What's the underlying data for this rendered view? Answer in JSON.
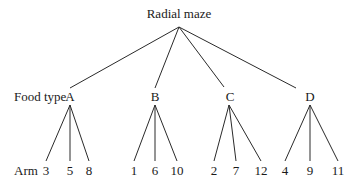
{
  "title": "Radial maze",
  "levels": {
    "food_label": "Food type",
    "arm_label": "Arm"
  },
  "root": {
    "label": "Radial maze",
    "x": 179,
    "y": 18,
    "apex_y": 27
  },
  "food_types": [
    {
      "label": "A",
      "x": 70,
      "y": 101,
      "edge_top": [
        70,
        88
      ],
      "apex": [
        70,
        105
      ],
      "arms": [
        {
          "label": "3",
          "x": 46
        },
        {
          "label": "5",
          "x": 70
        },
        {
          "label": "8",
          "x": 89
        }
      ]
    },
    {
      "label": "B",
      "x": 155,
      "y": 101,
      "edge_top": [
        155,
        88
      ],
      "apex": [
        155,
        105
      ],
      "arms": [
        {
          "label": "1",
          "x": 134
        },
        {
          "label": "6",
          "x": 155
        },
        {
          "label": "10",
          "x": 177
        }
      ]
    },
    {
      "label": "C",
      "x": 230,
      "y": 101,
      "edge_top": [
        224,
        87
      ],
      "apex": [
        229,
        105
      ],
      "arms": [
        {
          "label": "2",
          "x": 214
        },
        {
          "label": "7",
          "x": 236
        },
        {
          "label": "12",
          "x": 261
        }
      ]
    },
    {
      "label": "D",
      "x": 310,
      "y": 101,
      "edge_top": [
        296,
        88
      ],
      "apex": [
        310,
        105
      ],
      "arms": [
        {
          "label": "4",
          "x": 285
        },
        {
          "label": "9",
          "x": 310
        },
        {
          "label": "11",
          "x": 338
        }
      ]
    }
  ],
  "arm_row": {
    "label_y": 175,
    "line_end_y": 161
  }
}
